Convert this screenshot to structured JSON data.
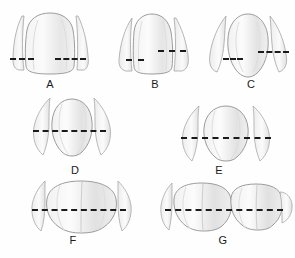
{
  "image": {
    "kind": "dental-anatomy-diagram",
    "subject": "tooth contact areas marked with dashed lines",
    "background_color": "#fefefe",
    "outline_color": "#9a9a9a",
    "shade_color": "#e8e8e8",
    "dash_color": "#1a1a1a",
    "width": 295,
    "height": 258
  },
  "figures": [
    {
      "id": "A",
      "label": "A",
      "tooth_type": "maxillary-central-incisor",
      "label_x": 50,
      "label_y": 78,
      "dashes": [
        {
          "name": "contact-dash-left",
          "x": 10,
          "y": 58,
          "width": 24
        },
        {
          "name": "contact-dash-right",
          "x": 55,
          "y": 58,
          "width": 31
        }
      ]
    },
    {
      "id": "B",
      "label": "B",
      "tooth_type": "maxillary-lateral-incisor",
      "label_x": 155,
      "label_y": 78,
      "dashes": [
        {
          "name": "contact-dash-left",
          "x": 126,
          "y": 59,
          "width": 18
        },
        {
          "name": "contact-dash-right",
          "x": 158,
          "y": 50,
          "width": 28
        }
      ]
    },
    {
      "id": "C",
      "label": "C",
      "tooth_type": "maxillary-canine",
      "label_x": 251,
      "label_y": 78,
      "dashes": [
        {
          "name": "contact-dash-left",
          "x": 223,
          "y": 58,
          "width": 20
        },
        {
          "name": "contact-dash-right",
          "x": 258,
          "y": 51,
          "width": 31
        }
      ]
    },
    {
      "id": "D",
      "label": "D",
      "tooth_type": "maxillary-first-premolar",
      "label_x": 75,
      "label_y": 164,
      "dashes": [
        {
          "name": "contact-dash-through",
          "x": 33,
          "y": 130,
          "width": 73
        }
      ]
    },
    {
      "id": "E",
      "label": "E",
      "tooth_type": "maxillary-second-premolar",
      "label_x": 219,
      "label_y": 164,
      "dashes": [
        {
          "name": "contact-dash-through",
          "x": 181,
          "y": 137,
          "width": 90
        }
      ]
    },
    {
      "id": "F",
      "label": "F",
      "tooth_type": "maxillary-first-molar",
      "label_x": 73,
      "label_y": 234,
      "dashes": [
        {
          "name": "contact-dash-through",
          "x": 32,
          "y": 209,
          "width": 94
        }
      ]
    },
    {
      "id": "G",
      "label": "G",
      "tooth_type": "maxillary-second-and-third-molar",
      "label_x": 223,
      "label_y": 234,
      "dashes": [
        {
          "name": "contact-dash-through",
          "x": 165,
          "y": 209,
          "width": 118
        }
      ]
    }
  ]
}
